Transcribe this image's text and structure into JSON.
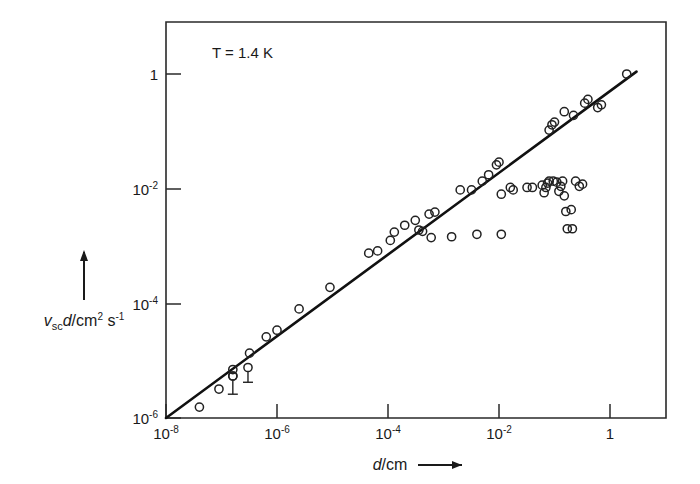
{
  "chart_data": {
    "type": "scatter",
    "title": "",
    "annotation": "T = 1.4 K",
    "annotation_parts": {
      "symbol": "T",
      "rest": "= 1.4 K"
    },
    "xlabel": "d/cm",
    "ylabel": "v_sc d/cm² s⁻¹",
    "xlabel_parts": {
      "symbol": "d",
      "unit": "/cm",
      "arrow": "→"
    },
    "ylabel_parts": {
      "symbol": "v",
      "subscript": "sc",
      "symbol2": "d",
      "unit": "/cm",
      "exp1": "2",
      "unit2": "s",
      "exp2": "-1",
      "arrow": "↑"
    },
    "xscale": "log",
    "yscale": "log",
    "xlim": [
      1e-08,
      20
    ],
    "ylim": [
      1e-06,
      2
    ],
    "grid": false,
    "legend": null,
    "xticks": [
      1e-08,
      1e-06,
      0.0001,
      0.01,
      1
    ],
    "xtick_labels": [
      "10⁻⁸",
      "10⁻⁶",
      "10⁻⁴",
      "10⁻²",
      "1"
    ],
    "xtick_mantissa": [
      "10",
      "10",
      "10",
      "10",
      "1"
    ],
    "xtick_exponent": [
      "-8",
      "-6",
      "-4",
      "-2",
      ""
    ],
    "yticks": [
      1e-06,
      0.0001,
      0.01,
      1
    ],
    "ytick_labels": [
      "10⁻⁶",
      "10⁻⁴",
      "10⁻²",
      "1"
    ],
    "ytick_mantissa": [
      "10",
      "10",
      "10",
      "1"
    ],
    "ytick_exponent": [
      "-6",
      "-4",
      "-2",
      ""
    ],
    "fit_line": {
      "description": "power law, slope 1 on log-log axes",
      "x": [
        1e-08,
        3.0
      ],
      "y": [
        1e-06,
        1.1
      ]
    },
    "series": [
      {
        "name": "linear branch",
        "marker": "open-circle",
        "points": [
          [
            4e-08,
            1.55e-06
          ],
          [
            9e-08,
            3.2e-06
          ],
          [
            1.6e-07,
            5.4e-06
          ],
          [
            1.6e-07,
            7e-06
          ],
          [
            3.2e-07,
            1.35e-05
          ],
          [
            6.4e-07,
            2.6e-05
          ],
          [
            1e-06,
            3.4e-05
          ],
          [
            2.5e-06,
            8e-05
          ],
          [
            9e-06,
            0.00019
          ],
          [
            4.5e-05,
            0.00075
          ],
          [
            6.5e-05,
            0.00082
          ],
          [
            0.00011,
            0.00125
          ],
          [
            0.00013,
            0.00175
          ],
          [
            0.0002,
            0.0023
          ],
          [
            0.00031,
            0.0028
          ],
          [
            0.00036,
            0.0019
          ],
          [
            0.00042,
            0.0018
          ],
          [
            0.00055,
            0.0036
          ],
          [
            0.0007,
            0.0039
          ],
          [
            0.002,
            0.0095
          ],
          [
            0.005,
            0.0135
          ],
          [
            0.0065,
            0.0175
          ],
          [
            0.009,
            0.026
          ],
          [
            0.01,
            0.029
          ],
          [
            0.08,
            0.105
          ],
          [
            0.09,
            0.13
          ],
          [
            0.1,
            0.145
          ],
          [
            0.15,
            0.22
          ],
          [
            0.22,
            0.19
          ],
          [
            0.35,
            0.31
          ],
          [
            0.4,
            0.36
          ],
          [
            0.6,
            0.26
          ],
          [
            0.7,
            0.29
          ],
          [
            2.0,
            1.0
          ]
        ]
      },
      {
        "name": "saturating branch",
        "marker": "open-circle",
        "points": [
          [
            0.0006,
            0.0014
          ],
          [
            0.0014,
            0.00145
          ],
          [
            0.004,
            0.0016
          ],
          [
            0.011,
            0.0016
          ],
          [
            0.0032,
            0.0095
          ],
          [
            0.011,
            0.008
          ],
          [
            0.016,
            0.0105
          ],
          [
            0.018,
            0.0095
          ],
          [
            0.032,
            0.0105
          ],
          [
            0.04,
            0.0105
          ],
          [
            0.06,
            0.0115
          ],
          [
            0.065,
            0.0085
          ],
          [
            0.07,
            0.0105
          ],
          [
            0.075,
            0.0125
          ],
          [
            0.08,
            0.0135
          ],
          [
            0.095,
            0.0135
          ],
          [
            0.11,
            0.013
          ],
          [
            0.12,
            0.009
          ],
          [
            0.13,
            0.011
          ],
          [
            0.14,
            0.0135
          ],
          [
            0.15,
            0.0075
          ],
          [
            0.24,
            0.0135
          ],
          [
            0.28,
            0.011
          ],
          [
            0.32,
            0.012
          ],
          [
            0.16,
            0.004
          ],
          [
            0.2,
            0.0043
          ],
          [
            0.17,
            0.002
          ],
          [
            0.21,
            0.002
          ]
        ]
      }
    ],
    "error_points": [
      {
        "x": 1.6e-07,
        "y": 5.4e-06,
        "y_low": 2.6e-06
      },
      {
        "x": 3e-07,
        "y": 7.6e-06,
        "y_low": 4.2e-06
      }
    ]
  }
}
